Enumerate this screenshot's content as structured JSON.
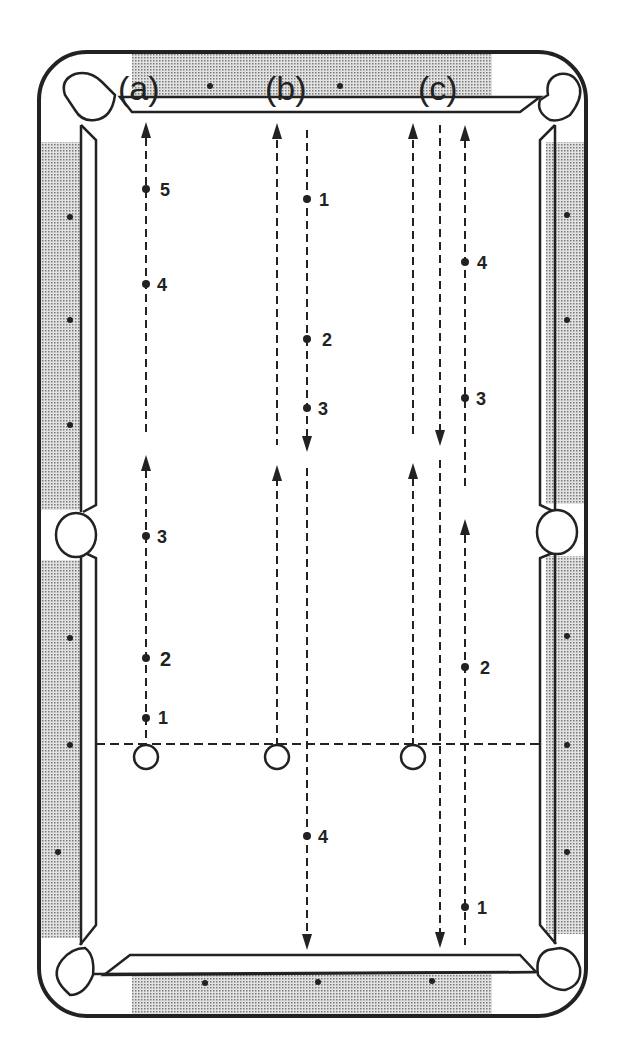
{
  "diagram": {
    "type": "billiards-table-shot-paths",
    "columns": [
      {
        "label": "(a)",
        "x": 146
      },
      {
        "label": "(b)",
        "x": 295
      },
      {
        "label": "(c)",
        "x": 435
      }
    ],
    "colors": {
      "ink": "#222222",
      "rail": "#b8b8b8",
      "cloth": "#ffffff"
    },
    "head_string_y": 744,
    "cue_balls": [
      {
        "id": "a",
        "x": 146,
        "y": 757
      },
      {
        "id": "b",
        "x": 277,
        "y": 757
      },
      {
        "id": "c",
        "x": 413,
        "y": 757
      }
    ],
    "points": {
      "a": [
        {
          "label": "1",
          "x": 146,
          "y": 718
        },
        {
          "label": "2",
          "x": 146,
          "y": 658
        },
        {
          "label": "3",
          "x": 146,
          "y": 536
        },
        {
          "label": "4",
          "x": 146,
          "y": 284
        },
        {
          "label": "5",
          "x": 146,
          "y": 189
        }
      ],
      "b": [
        {
          "label": "1",
          "x": 307,
          "y": 199
        },
        {
          "label": "2",
          "x": 307,
          "y": 339
        },
        {
          "label": "3",
          "x": 307,
          "y": 408
        },
        {
          "label": "4",
          "x": 307,
          "y": 836
        }
      ],
      "c": [
        {
          "label": "1",
          "x": 465,
          "y": 907
        },
        {
          "label": "2",
          "x": 465,
          "y": 667
        },
        {
          "label": "3",
          "x": 465,
          "y": 398
        },
        {
          "label": "4",
          "x": 465,
          "y": 262
        }
      ]
    }
  }
}
